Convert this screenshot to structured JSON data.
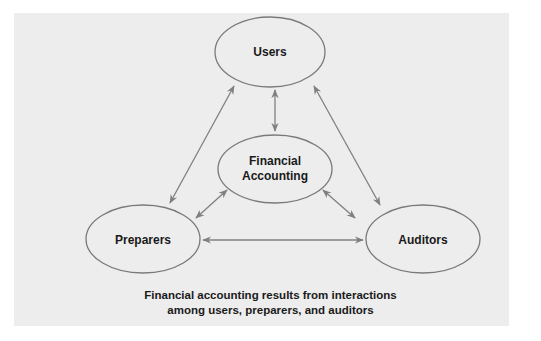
{
  "diagram": {
    "nodes": {
      "users": {
        "label": "Users"
      },
      "financial_accounting": {
        "label_line1": "Financial",
        "label_line2": "Accounting"
      },
      "preparers": {
        "label": "Preparers"
      },
      "auditors": {
        "label": "Auditors"
      }
    },
    "edges": [
      {
        "from": "users",
        "to": "financial_accounting",
        "type": "bidirectional"
      },
      {
        "from": "users",
        "to": "preparers",
        "type": "bidirectional"
      },
      {
        "from": "users",
        "to": "auditors",
        "type": "bidirectional"
      },
      {
        "from": "financial_accounting",
        "to": "preparers",
        "type": "bidirectional"
      },
      {
        "from": "financial_accounting",
        "to": "auditors",
        "type": "bidirectional"
      },
      {
        "from": "preparers",
        "to": "auditors",
        "type": "bidirectional"
      }
    ],
    "caption_line1": "Financial accounting results from interactions",
    "caption_line2": "among users, preparers, and auditors"
  },
  "colors": {
    "panel_background": "#ededed",
    "ellipse_stroke": "#7a7a7a",
    "arrow_color": "#808080",
    "text_color": "#1a1a1a"
  }
}
